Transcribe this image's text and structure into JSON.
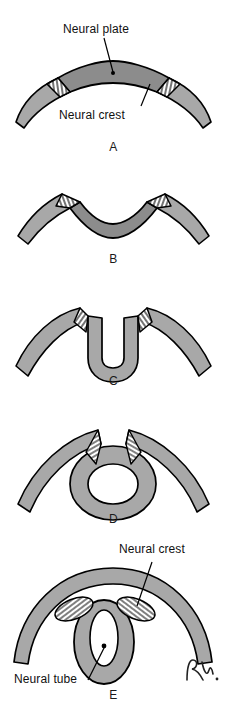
{
  "figure": {
    "title_artifact": "",
    "panels": [
      {
        "id": "A",
        "letter": "A",
        "caption_labels": [
          {
            "name": "neural-plate",
            "text": "Neural plate"
          },
          {
            "name": "neural-crest",
            "text": "Neural crest"
          }
        ]
      },
      {
        "id": "B",
        "letter": "B",
        "caption_labels": []
      },
      {
        "id": "C",
        "letter": "C",
        "caption_labels": []
      },
      {
        "id": "D",
        "letter": "D",
        "caption_labels": []
      },
      {
        "id": "E",
        "letter": "E",
        "caption_labels": [
          {
            "name": "neural-crest",
            "text": "Neural crest"
          },
          {
            "name": "neural-tube",
            "text": "Neural tube"
          }
        ]
      }
    ],
    "labels": {
      "neural_plate": "Neural plate",
      "neural_crest_a": "Neural crest",
      "neural_crest_e": "Neural crest",
      "neural_tube": "Neural tube"
    },
    "signature": "R.",
    "colors": {
      "ectoderm_fill": "#a8a8a8",
      "neural_plate_fill": "#8c8c8c",
      "neural_crest_fill": "#ffffff",
      "outline": "#000000",
      "background": "#ffffff",
      "label_text": "#111111"
    }
  }
}
